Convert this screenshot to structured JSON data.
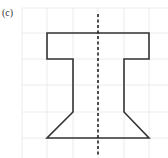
{
  "figure": {
    "label": "(c)",
    "grid": {
      "color": "#ececec",
      "x_lines": [
        22,
        47,
        73,
        98,
        124,
        149
      ],
      "y_lines": [
        8,
        33,
        59,
        85,
        112,
        138
      ]
    },
    "shape": {
      "name": "I-section with flared base",
      "stroke": "#333333",
      "points": "47,33 149,33 149,59 124,59 124,112 149,138 47,138 73,112 73,59 47,59"
    },
    "axis_of_symmetry": {
      "x": 98,
      "y1": 14,
      "y2": 156,
      "style": "dashed",
      "color": "#222222"
    }
  }
}
